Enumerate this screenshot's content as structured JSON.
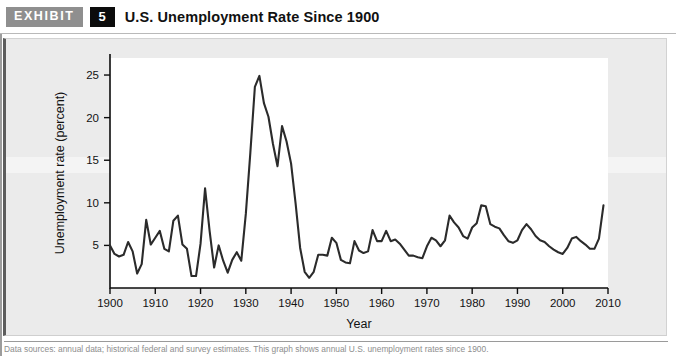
{
  "header": {
    "badge_label": "EXHIBIT",
    "exhibit_number": "5",
    "title": "U.S. Unemployment Rate Since 1900"
  },
  "caption": "Data sources: annual data; historical federal and survey estimates. This graph shows annual U.S. unemployment rates since 1900.",
  "colors": {
    "badge_gray": "#8f8f8f",
    "badge_black": "#0c0c0c",
    "panel_background": "#ebebeb",
    "plot_background": "#ffffff",
    "line_color": "#2b2b2b",
    "axis_color": "#0d0d0d"
  },
  "chart_data": {
    "type": "line",
    "title": "U.S. Unemployment Rate Since 1900",
    "xlabel": "Year",
    "ylabel": "Unemployment rate (percent)",
    "xlim": [
      1900,
      2010
    ],
    "ylim": [
      0,
      27
    ],
    "xticks": [
      1900,
      1910,
      1920,
      1930,
      1940,
      1950,
      1960,
      1970,
      1980,
      1990,
      2000,
      2010
    ],
    "xtick_labels": [
      "1900",
      "1910",
      "1920",
      "1930",
      "1940",
      "1950",
      "1960",
      "1970",
      "1980",
      "1990",
      "2000",
      "2010"
    ],
    "yticks": [
      5,
      10,
      15,
      20,
      25
    ],
    "ytick_labels": [
      "5",
      "10",
      "15",
      "20",
      "25"
    ],
    "grid": false,
    "legend": false,
    "series": [
      {
        "name": "Unemployment rate",
        "x": [
          1900,
          1901,
          1902,
          1903,
          1904,
          1905,
          1906,
          1907,
          1908,
          1909,
          1910,
          1911,
          1912,
          1913,
          1914,
          1915,
          1916,
          1917,
          1918,
          1919,
          1920,
          1921,
          1922,
          1923,
          1924,
          1925,
          1926,
          1927,
          1928,
          1929,
          1930,
          1931,
          1932,
          1933,
          1934,
          1935,
          1936,
          1937,
          1938,
          1939,
          1940,
          1941,
          1942,
          1943,
          1944,
          1945,
          1946,
          1947,
          1948,
          1949,
          1950,
          1951,
          1952,
          1953,
          1954,
          1955,
          1956,
          1957,
          1958,
          1959,
          1960,
          1961,
          1962,
          1963,
          1964,
          1965,
          1966,
          1967,
          1968,
          1969,
          1970,
          1971,
          1972,
          1973,
          1974,
          1975,
          1976,
          1977,
          1978,
          1979,
          1980,
          1981,
          1982,
          1983,
          1984,
          1985,
          1986,
          1987,
          1988,
          1989,
          1990,
          1991,
          1992,
          1993,
          1994,
          1995,
          1996,
          1997,
          1998,
          1999,
          2000,
          2001,
          2002,
          2003,
          2004,
          2005,
          2006,
          2007,
          2008,
          2009
        ],
        "values": [
          5.0,
          4.0,
          3.7,
          3.9,
          5.4,
          4.3,
          1.7,
          2.8,
          8.0,
          5.1,
          5.9,
          6.7,
          4.6,
          4.3,
          7.9,
          8.5,
          5.1,
          4.6,
          1.4,
          1.4,
          5.2,
          11.7,
          6.7,
          2.4,
          5.0,
          3.2,
          1.8,
          3.3,
          4.2,
          3.2,
          8.7,
          15.9,
          23.6,
          24.9,
          21.7,
          20.1,
          16.9,
          14.3,
          19.0,
          17.2,
          14.6,
          9.9,
          4.7,
          1.9,
          1.2,
          1.9,
          3.9,
          3.9,
          3.8,
          5.9,
          5.3,
          3.3,
          3.0,
          2.9,
          5.5,
          4.4,
          4.1,
          4.3,
          6.8,
          5.5,
          5.5,
          6.7,
          5.5,
          5.7,
          5.2,
          4.5,
          3.8,
          3.8,
          3.6,
          3.5,
          4.9,
          5.9,
          5.6,
          4.9,
          5.6,
          8.5,
          7.7,
          7.1,
          6.1,
          5.8,
          7.1,
          7.6,
          9.7,
          9.6,
          7.5,
          7.2,
          7.0,
          6.2,
          5.5,
          5.3,
          5.6,
          6.8,
          7.5,
          6.9,
          6.1,
          5.6,
          5.4,
          4.9,
          4.5,
          4.2,
          4.0,
          4.7,
          5.8,
          6.0,
          5.5,
          5.1,
          4.6,
          4.6,
          5.8,
          9.7
        ]
      }
    ]
  }
}
